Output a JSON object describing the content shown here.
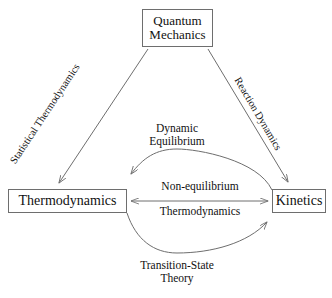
{
  "diagram": {
    "type": "relationship-triangle",
    "stroke_color": "#6e6e6e",
    "text_color": "#111111",
    "background_color": "#ffffff",
    "nodes": [
      {
        "id": "quantum-mechanics",
        "lines": [
          "Quantum",
          "Mechanics"
        ],
        "position": "top"
      },
      {
        "id": "thermodynamics",
        "lines": [
          "Thermodynamics"
        ],
        "position": "bottom-left"
      },
      {
        "id": "kinetics",
        "lines": [
          "Kinetics"
        ],
        "position": "bottom-right"
      }
    ],
    "edges": [
      {
        "id": "statistical-thermodynamics",
        "label_lines": [
          "Statistical Thermodynamics"
        ],
        "from": "quantum-mechanics",
        "to": "thermodynamics",
        "style": "straight",
        "arrowheads": "to"
      },
      {
        "id": "reaction-dynamics",
        "label_lines": [
          "Reaction Dynamics"
        ],
        "from": "quantum-mechanics",
        "to": "kinetics",
        "style": "straight",
        "arrowheads": "to"
      },
      {
        "id": "dynamic-equilibrium",
        "label_lines": [
          "Dynamic",
          "Equilibrium"
        ],
        "from": "kinetics",
        "to": "thermodynamics",
        "style": "curve-upper",
        "arrowheads": "to"
      },
      {
        "id": "non-equilibrium-thermodynamics",
        "label_lines": [
          "Non-equilibrium",
          "Thermodynamics"
        ],
        "from": "thermodynamics",
        "to": "kinetics",
        "style": "straight-horizontal",
        "arrowheads": "both"
      },
      {
        "id": "transition-state-theory",
        "label_lines": [
          "Transition-State",
          "Theory"
        ],
        "from": "thermodynamics",
        "to": "kinetics",
        "style": "curve-lower",
        "arrowheads": "to"
      }
    ]
  }
}
